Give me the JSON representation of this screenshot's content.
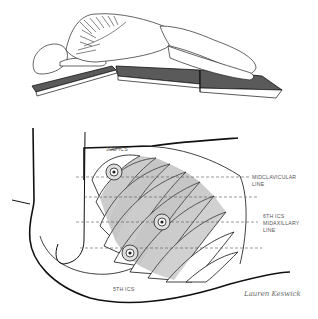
{
  "figure": {
    "top_panel": {
      "description": "Patient in lateral decubitus position on flexed operating table, posterior view showing spine"
    },
    "bottom_panel": {
      "description": "Rib cage with thoracoscopic port placements",
      "labels": {
        "third_ics": "3RD ICS",
        "midclavicular_line_1": "MIDCLAVICULAR",
        "midclavicular_line_2": "LINE",
        "sixth_ics": "6TH ICS",
        "midaxillary_line_1": "MIDAXILLARY",
        "midaxillary_line_2": "LINE",
        "fifth_ics": "5TH ICS"
      },
      "signature": "Lauren Keswick"
    },
    "colors": {
      "ink": "#1a1a1a",
      "table_pad": "#5a5a5a",
      "label": "#555555",
      "background": "#ffffff"
    }
  }
}
